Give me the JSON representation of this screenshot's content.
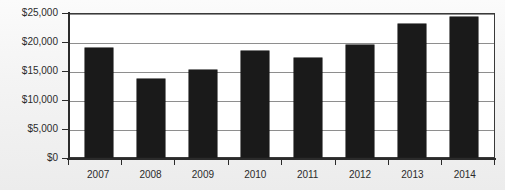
{
  "chart_data": {
    "type": "bar",
    "title": "",
    "subtitle": "",
    "xlabel": "",
    "ylabel": "",
    "categories": [
      "2007",
      "2008",
      "2009",
      "2010",
      "2011",
      "2012",
      "2013",
      "2014"
    ],
    "values": [
      19000,
      13600,
      15200,
      18450,
      17250,
      19500,
      23300,
      24500
    ],
    "series": [
      {
        "name": "",
        "values": [
          19000,
          13600,
          15200,
          18450,
          17250,
          19500,
          23300,
          24500
        ]
      }
    ],
    "ylim": [
      0,
      25000
    ],
    "ytick_values": [
      0,
      5000,
      10000,
      15000,
      20000,
      25000
    ],
    "ytick_labels": [
      "$0",
      "$5,000",
      "$10,000",
      "$15,000",
      "$20,000",
      "$25,000"
    ],
    "xtick_labels": [
      "2007",
      "2008",
      "2009",
      "2010",
      "2011",
      "2012",
      "2013",
      "2014"
    ],
    "grid": true,
    "grid_axis": "y",
    "legend": false,
    "legend_position": "none",
    "annotations": [],
    "bar_color": "#1a1a1a",
    "plot_background": "#ffffff",
    "figure_background": "#f2f2f2",
    "axis_color": "#2b2b2b",
    "grid_color": "#8e8e8e"
  }
}
